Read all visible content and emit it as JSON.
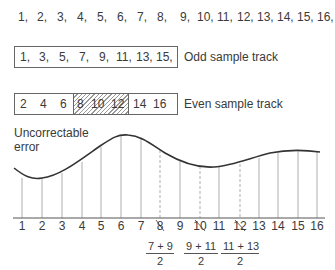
{
  "all_samples": [
    "1,",
    "2,",
    "3,",
    "4,",
    "5,",
    "6,",
    "7,",
    "8,",
    "9,",
    "10,",
    "11,",
    "12,",
    "13,",
    "14,",
    "15,",
    "16,"
  ],
  "odd_track": {
    "samples": [
      "1,",
      "3,",
      "5,",
      "7,",
      "9,",
      "11,",
      "13,",
      "15,"
    ],
    "label": "Odd sample track"
  },
  "even_track": {
    "samples_left": [
      "2",
      "4",
      "6"
    ],
    "samples_hatched": [
      "8",
      "10",
      "12"
    ],
    "samples_right": [
      "14",
      "16"
    ],
    "label": "Even sample track"
  },
  "error_label": {
    "line1": "Uncorrectable",
    "line2": "error"
  },
  "axis": {
    "ticks": [
      "1",
      "2",
      "3",
      "4",
      "5",
      "6",
      "7",
      "8",
      "9",
      "10",
      "11",
      "12",
      "13",
      "14",
      "15",
      "16"
    ],
    "crossed_out": [
      "8",
      "10",
      "12"
    ]
  },
  "interpolations": [
    {
      "numerator": "7 + 9",
      "denominator": "2"
    },
    {
      "numerator": "9 + 11",
      "denominator": "2"
    },
    {
      "numerator": "11 + 13",
      "denominator": "2"
    }
  ],
  "colors": {
    "line": "#333333",
    "tick": "#999999",
    "hatch": "#9a9a9a"
  }
}
